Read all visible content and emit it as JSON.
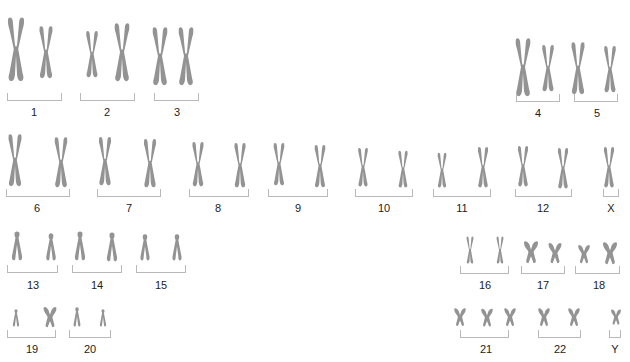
{
  "diagram": {
    "type": "karyotype",
    "chromosome_color": "#939393",
    "bracket_color": "#b9b9b9",
    "groups": [
      {
        "label": "1",
        "count": 2
      },
      {
        "label": "2",
        "count": 2
      },
      {
        "label": "3",
        "count": 2
      },
      {
        "label": "4",
        "count": 2
      },
      {
        "label": "5",
        "count": 2
      },
      {
        "label": "6",
        "count": 2
      },
      {
        "label": "7",
        "count": 2
      },
      {
        "label": "8",
        "count": 2
      },
      {
        "label": "9",
        "count": 2
      },
      {
        "label": "10",
        "count": 2
      },
      {
        "label": "11",
        "count": 2
      },
      {
        "label": "12",
        "count": 2
      },
      {
        "label": "X",
        "count": 1
      },
      {
        "label": "13",
        "count": 2
      },
      {
        "label": "14",
        "count": 2
      },
      {
        "label": "15",
        "count": 2
      },
      {
        "label": "16",
        "count": 2
      },
      {
        "label": "17",
        "count": 2
      },
      {
        "label": "18",
        "count": 2
      },
      {
        "label": "19",
        "count": 2
      },
      {
        "label": "20",
        "count": 2
      },
      {
        "label": "21",
        "count": 3
      },
      {
        "label": "22",
        "count": 2
      },
      {
        "label": "Y",
        "count": 1
      }
    ]
  }
}
